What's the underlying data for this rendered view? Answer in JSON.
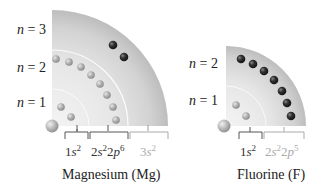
{
  "magnesium": {
    "name": "Magnesium (Mg)",
    "shells": [
      {
        "label_n": "n",
        "label_eq": " = 3"
      },
      {
        "label_n": "n",
        "label_eq": " = 2"
      },
      {
        "label_n": "n",
        "label_eq": " = 1"
      }
    ],
    "config": [
      {
        "orb": "1",
        "s": "s",
        "sup": "2",
        "color": "#333333"
      },
      {
        "orb": "2",
        "s": "s",
        "sup": "2",
        "orb2": "2",
        "p": "p",
        "sup2": "6",
        "color": "#333333"
      },
      {
        "orb": "3",
        "s": "s",
        "sup": "2",
        "color": "#aaaaaa"
      }
    ]
  },
  "fluorine": {
    "name": "Fluorine (F)",
    "shells": [
      {
        "label_n": "n",
        "label_eq": " = 2"
      },
      {
        "label_n": "n",
        "label_eq": " = 1"
      }
    ],
    "config": [
      {
        "orb": "1",
        "s": "s",
        "sup": "2",
        "color": "#333333"
      },
      {
        "orb": "2",
        "s": "s",
        "sup": "2",
        "orb2": "2",
        "p": "p",
        "sup2": "5",
        "color": "#aaaaaa"
      }
    ]
  },
  "colors": {
    "outer_shell": "#c8c8c8",
    "inner_electron": "#a8a8a8",
    "valence_electron": "#222222",
    "core_text": "#333333",
    "valence_text": "#aaaaaa"
  }
}
